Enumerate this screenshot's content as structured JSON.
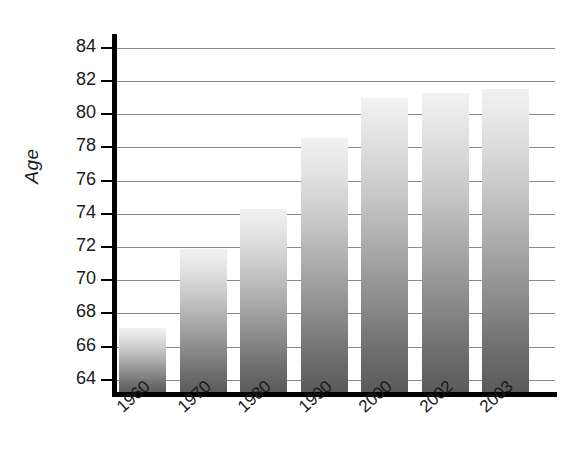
{
  "chart_data": {
    "type": "bar",
    "title": "",
    "xlabel": "",
    "ylabel": "Age",
    "categories": [
      "1960",
      "1970",
      "1980",
      "1990",
      "2000",
      "2002",
      "2003"
    ],
    "values": [
      67.1,
      71.9,
      74.3,
      78.6,
      81.0,
      81.3,
      81.5
    ],
    "ylim": [
      63.2,
      84.6
    ],
    "yticks": [
      64,
      66,
      68,
      70,
      72,
      74,
      76,
      78,
      80,
      82,
      84
    ],
    "ytick_labels": [
      "64",
      "66",
      "68",
      "70",
      "72",
      "74",
      "76",
      "78",
      "80",
      "82",
      "84"
    ],
    "grid": true,
    "legend": false,
    "bar_style": {
      "gradient_top": "#f2f2f2",
      "gradient_bottom": "#5a5a5a",
      "axis_color": "#000000",
      "gridline_color": "#8a8a8a"
    }
  }
}
